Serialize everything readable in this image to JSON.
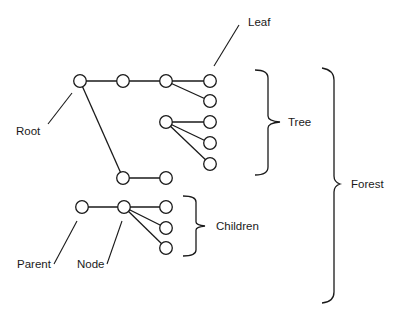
{
  "diagram": {
    "labels": {
      "leaf": "Leaf",
      "root": "Root",
      "tree": "Tree",
      "forest": "Forest",
      "children": "Children",
      "parent": "Parent",
      "node": "Node"
    },
    "colors": {
      "stroke": "#1a1a1a",
      "background": "#ffffff"
    },
    "trees": [
      {
        "name": "tree-1",
        "nodes": [
          {
            "id": "root",
            "x": 80,
            "y": 81
          },
          {
            "id": "a",
            "x": 123,
            "y": 81
          },
          {
            "id": "b",
            "x": 166,
            "y": 81
          },
          {
            "id": "leaf1",
            "x": 210,
            "y": 81
          },
          {
            "id": "leaf2",
            "x": 210,
            "y": 101
          },
          {
            "id": "c",
            "x": 166,
            "y": 122
          },
          {
            "id": "leaf3",
            "x": 210,
            "y": 122
          },
          {
            "id": "leaf4",
            "x": 210,
            "y": 143
          },
          {
            "id": "leaf5",
            "x": 210,
            "y": 164
          },
          {
            "id": "d",
            "x": 123,
            "y": 178
          },
          {
            "id": "e",
            "x": 166,
            "y": 178
          }
        ]
      },
      {
        "name": "tree-2",
        "nodes": [
          {
            "id": "parent",
            "x": 82,
            "y": 207
          },
          {
            "id": "node",
            "x": 124,
            "y": 207
          },
          {
            "id": "child1",
            "x": 166,
            "y": 207
          },
          {
            "id": "child2",
            "x": 166,
            "y": 228
          },
          {
            "id": "child3",
            "x": 166,
            "y": 248
          }
        ]
      }
    ]
  }
}
